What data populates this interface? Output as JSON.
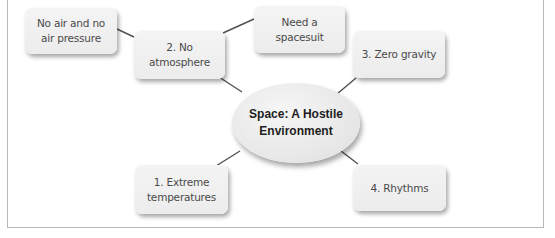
{
  "diagram": {
    "type": "mind-map",
    "center": {
      "label": "Space: A Hostile Environment"
    },
    "nodes": [
      {
        "id": "temp",
        "label": "1. Extreme temperatures",
        "parent": "center"
      },
      {
        "id": "atm",
        "label": "2. No atmosphere",
        "parent": "center"
      },
      {
        "id": "grav",
        "label": "3. Zero gravity",
        "parent": "center"
      },
      {
        "id": "rhy",
        "label": "4. Rhythms",
        "parent": "center"
      },
      {
        "id": "air",
        "label": "No air and no air pressure",
        "parent": "atm"
      },
      {
        "id": "suit",
        "label": "Need a spacesuit",
        "parent": "atm"
      }
    ],
    "colors": {
      "node_fill": "#eeeeee",
      "connector": "#505050",
      "node_text": "#4a4a4a",
      "center_text": "#1e1e1e",
      "frame": "#b8b8b8"
    }
  }
}
